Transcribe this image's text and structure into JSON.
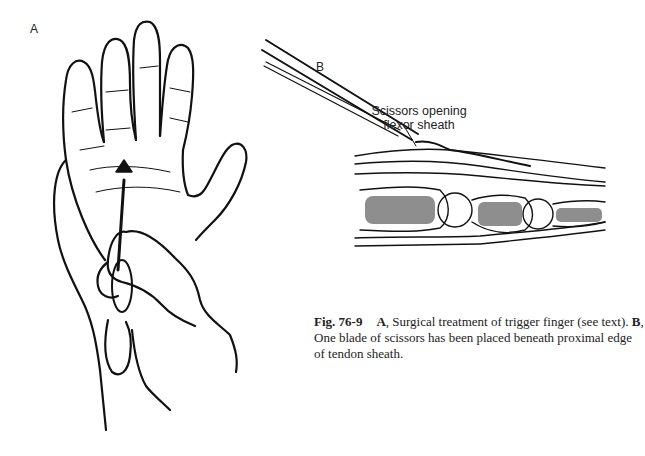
{
  "figure": {
    "panels": [
      {
        "label": "A",
        "description": "Hand with scissors inserted at palm (trigger finger release)"
      },
      {
        "label": "B",
        "description": "Cross-section of finger with scissors opening flexor sheath"
      }
    ],
    "callout": {
      "line1": "Scissors opening",
      "line2": "flexor sheath"
    },
    "caption": {
      "number": "Fig. 76-9",
      "part_a_label": "A",
      "part_a_text": ", Surgical treatment of trigger finger (see text). ",
      "part_b_label": "B",
      "part_b_text": ", One blade of scissors has been placed beneath proximal edge of tendon sheath."
    }
  }
}
